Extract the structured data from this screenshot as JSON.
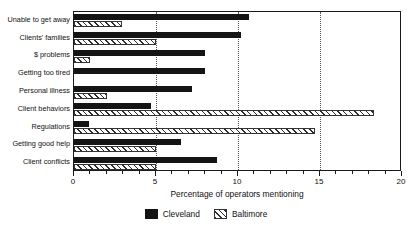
{
  "chart_data": {
    "type": "bar",
    "orientation": "horizontal",
    "title": "",
    "xlabel": "Percentage of operators mentioning",
    "ylabel": "",
    "xlim": [
      0,
      20
    ],
    "xticks": [
      0,
      5,
      10,
      15,
      20
    ],
    "xtick_labels": [
      "0",
      "5",
      "10",
      "15",
      "20"
    ],
    "grid": "vertical dotted gridlines at 5, 10, 15",
    "legend_position": "bottom-center",
    "categories": [
      "Unable to get away",
      "Clients' families",
      "$ problems",
      "Getting too tired",
      "Personal illness",
      "Client behaviors",
      "Regulations",
      "Getting good help",
      "Client conflicts"
    ],
    "series": [
      {
        "name": "Cleveland",
        "fill": "solid-black",
        "color": "#141414",
        "values": [
          10.7,
          10.2,
          8.0,
          8.0,
          7.2,
          4.7,
          0.9,
          6.5,
          8.7
        ]
      },
      {
        "name": "Baltimore",
        "fill": "diagonal-hatch",
        "color": "#2b2b2b",
        "values": [
          2.9,
          5.0,
          1.0,
          0.0,
          2.0,
          18.3,
          14.7,
          5.0,
          5.0
        ]
      }
    ]
  },
  "legend": {
    "entries": [
      {
        "label": "Cleveland"
      },
      {
        "label": "Baltimore"
      }
    ]
  },
  "axis": {
    "x_title": "Percentage of operators mentioning"
  }
}
